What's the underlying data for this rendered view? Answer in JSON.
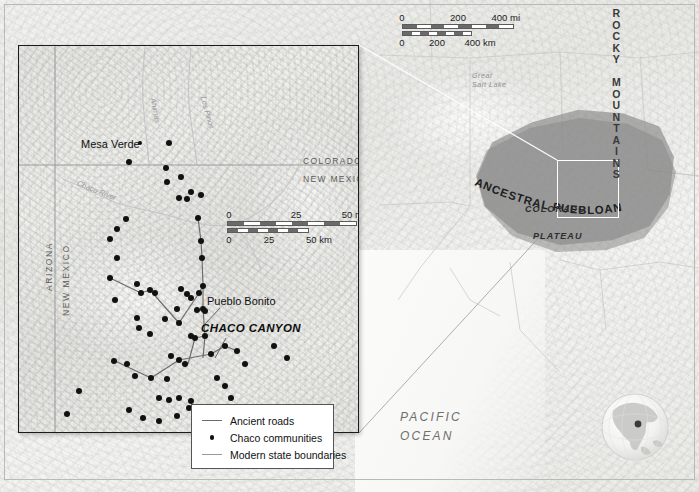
{
  "figure": {
    "type": "reference-map"
  },
  "overview_map": {
    "name": "regional-overview-map",
    "labels": {
      "rocky_mountains": "ROCKY MOUNTAINS",
      "cultural_area": "ANCESTRAL PUEBLOAN CULTURAL AREA",
      "colorado": "COLORADO",
      "plateau": "PLATEAU",
      "great_salt_lake": "Great\nSalt Lake",
      "great_salt_lake_line1": "Great",
      "great_salt_lake_line2": "Salt Lake",
      "pacific_line1": "PACIFIC",
      "pacific_line2": "OCEAN"
    },
    "scale_bar": {
      "miles": {
        "ticks": [
          "0",
          "200",
          "400 mi"
        ],
        "unit": "mi",
        "max": 400
      },
      "kilometers": {
        "ticks": [
          "0",
          "200",
          "400 km"
        ],
        "unit": "km",
        "max": 400
      }
    },
    "locator_box": {
      "name": "detail-area-locator"
    },
    "colors": {
      "cultural_area_fill": "#8c8c8c",
      "locator_outline": "#ffffff",
      "land": "#ededea"
    }
  },
  "inset_map": {
    "name": "chaco-canyon-detail-map",
    "labels": {
      "mesa_verde": "Mesa Verde",
      "pueblo_bonito": "Pueblo Bonito",
      "chaco_canyon": "CHACO CANYON",
      "colorado": "COLORADO",
      "new_mexico": "NEW MEXICO",
      "arizona_vertical": "ARIZONA",
      "new_mexico_vertical": "NEW MEXICO",
      "chaco_river": "Chaco River",
      "los_pinos": "Los Pinos",
      "animas": "Animas"
    },
    "scale_bar": {
      "miles": {
        "ticks": [
          "0",
          "25",
          "50 mi"
        ],
        "unit": "mi",
        "max": 50
      },
      "kilometers": {
        "ticks": [
          "0",
          "25",
          "50 km"
        ],
        "unit": "km",
        "max": 50
      }
    },
    "colors": {
      "community_dot": "#111111",
      "ancient_road": "#6b6b6b",
      "state_boundary": "#9a9a9a",
      "frame": "#1b1b1b"
    },
    "community_count": 62
  },
  "legend": {
    "name": "map-legend",
    "items": [
      {
        "key": "line-road",
        "label": "Ancient roads"
      },
      {
        "key": "dot",
        "label": "Chaco communities"
      },
      {
        "key": "line-state",
        "label": "Modern state boundaries"
      }
    ]
  },
  "globe_inset": {
    "name": "globe-locator",
    "continent": "North America"
  },
  "map_data": {
    "communities": [
      [
        150,
        97
      ],
      [
        110,
        116
      ],
      [
        147,
        122
      ],
      [
        148,
        136
      ],
      [
        172,
        146
      ],
      [
        162,
        131
      ],
      [
        107,
        173
      ],
      [
        98,
        183
      ],
      [
        91,
        193
      ],
      [
        98,
        212
      ],
      [
        91,
        232
      ],
      [
        160,
        152
      ],
      [
        168,
        153
      ],
      [
        182,
        149
      ],
      [
        179,
        172
      ],
      [
        182,
        195
      ],
      [
        183,
        212
      ],
      [
        184,
        240
      ],
      [
        184,
        263
      ],
      [
        96,
        254
      ],
      [
        118,
        238
      ],
      [
        122,
        247
      ],
      [
        131,
        244
      ],
      [
        136,
        247
      ],
      [
        118,
        272
      ],
      [
        120,
        282
      ],
      [
        131,
        288
      ],
      [
        146,
        273
      ],
      [
        160,
        277
      ],
      [
        158,
        263
      ],
      [
        162,
        243
      ],
      [
        168,
        248
      ],
      [
        172,
        252
      ],
      [
        180,
        247
      ],
      [
        178,
        264
      ],
      [
        186,
        265
      ],
      [
        172,
        290
      ],
      [
        176,
        292
      ],
      [
        186,
        290
      ],
      [
        152,
        310
      ],
      [
        160,
        314
      ],
      [
        166,
        318
      ],
      [
        95,
        315
      ],
      [
        108,
        318
      ],
      [
        116,
        330
      ],
      [
        132,
        332
      ],
      [
        148,
        333
      ],
      [
        140,
        352
      ],
      [
        150,
        354
      ],
      [
        160,
        352
      ],
      [
        172,
        355
      ],
      [
        192,
        308
      ],
      [
        206,
        300
      ],
      [
        218,
        305
      ],
      [
        226,
        318
      ],
      [
        198,
        332
      ],
      [
        206,
        340
      ],
      [
        212,
        352
      ],
      [
        214,
        362
      ],
      [
        110,
        364
      ],
      [
        124,
        372
      ],
      [
        140,
        375
      ],
      [
        158,
        370
      ],
      [
        170,
        362
      ],
      [
        184,
        368
      ],
      [
        60,
        345
      ],
      [
        48,
        368
      ],
      [
        206,
        382
      ],
      [
        224,
        378
      ],
      [
        240,
        372
      ]
    ],
    "roads": [
      [
        [
          91,
          232
        ],
        [
          122,
          247
        ],
        [
          131,
          244
        ],
        [
          160,
          277
        ]
      ],
      [
        [
          160,
          277
        ],
        [
          180,
          247
        ],
        [
          184,
          240
        ]
      ],
      [
        [
          184,
          263
        ],
        [
          184,
          240
        ],
        [
          183,
          212
        ],
        [
          182,
          195
        ],
        [
          179,
          172
        ]
      ],
      [
        [
          96,
          315
        ],
        [
          132,
          332
        ],
        [
          160,
          314
        ],
        [
          192,
          308
        ]
      ],
      [
        [
          192,
          308
        ],
        [
          206,
          300
        ],
        [
          218,
          305
        ]
      ],
      [
        [
          168,
          318
        ],
        [
          176,
          292
        ],
        [
          186,
          290
        ]
      ]
    ]
  }
}
